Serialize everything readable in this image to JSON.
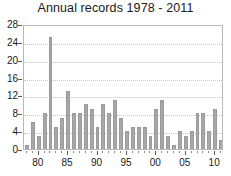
{
  "chart_data": {
    "type": "bar",
    "title": "Annual records 1978 - 2011",
    "xlabel": "",
    "ylabel": "",
    "ylim": [
      0,
      28
    ],
    "yticks": [
      0,
      4,
      8,
      12,
      16,
      20,
      24,
      28
    ],
    "grid": true,
    "legend": false,
    "bar_color": "#a8a8a8",
    "bar_edge_color": "#9a9a9a",
    "categories": [
      "1978",
      "1979",
      "1980",
      "1981",
      "1982",
      "1983",
      "1984",
      "1985",
      "1986",
      "1987",
      "1988",
      "1989",
      "1990",
      "1991",
      "1992",
      "1993",
      "1994",
      "1995",
      "1996",
      "1997",
      "1998",
      "1999",
      "2000",
      "2001",
      "2002",
      "2003",
      "2004",
      "2005",
      "2006",
      "2007",
      "2008",
      "2009",
      "2010",
      "2011"
    ],
    "xtick_labels": [
      "80",
      "85",
      "90",
      "95",
      "00",
      "05",
      "10"
    ],
    "xtick_categories": [
      "1980",
      "1985",
      "1990",
      "1995",
      "2000",
      "2005",
      "2010"
    ],
    "values": [
      1,
      6,
      3,
      8,
      25,
      5,
      7,
      13,
      8,
      8,
      10,
      9,
      5,
      10,
      8,
      11,
      7,
      4,
      5,
      5,
      5,
      3,
      9,
      11,
      3,
      1,
      4,
      3,
      4,
      8,
      8,
      4,
      9,
      2
    ]
  }
}
